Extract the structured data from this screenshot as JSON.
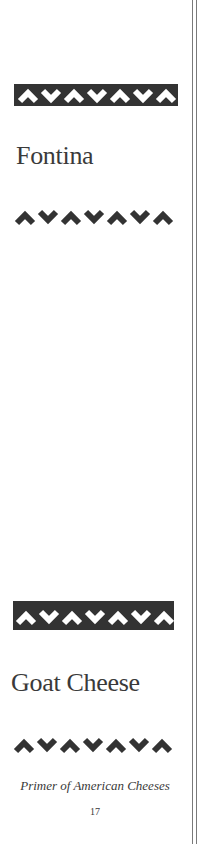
{
  "page": {
    "sections": [
      {
        "title": "Fontina"
      },
      {
        "title": "Goat Cheese"
      }
    ],
    "footer": {
      "book_title": "Primer of American Cheeses",
      "page_number": "17"
    },
    "ornaments": {
      "pattern": [
        "up",
        "down",
        "up",
        "down",
        "up",
        "down",
        "up"
      ],
      "band_color": "#333333",
      "chevron_color": "#333333"
    }
  }
}
